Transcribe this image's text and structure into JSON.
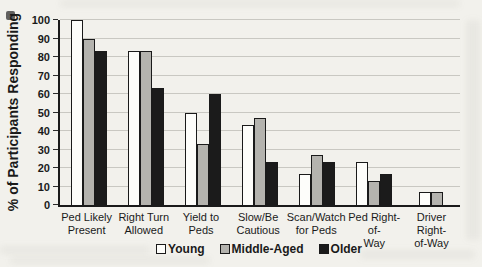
{
  "figure": {
    "background_color": "#f2f1ec",
    "axis_color": "#1a1a1a",
    "gridline_color": "#c9c8c2"
  },
  "chart_data": {
    "type": "bar",
    "title": "",
    "xlabel": "",
    "ylabel": "% of Participants Responding",
    "ylim": [
      0,
      100
    ],
    "ytick_step": 10,
    "yticks": [
      0,
      10,
      20,
      30,
      40,
      50,
      60,
      70,
      80,
      90,
      100
    ],
    "grid": "horizontal",
    "legend_position": "bottom",
    "categories": [
      "Ped Likely Present",
      "Right Turn Allowed",
      "Yield to Peds",
      "Slow/Be Cautious",
      "Scan/Watch for Peds",
      "Ped Right-of-Way",
      "Driver Right-of-Way"
    ],
    "category_label_lines": [
      [
        "Ped Likely",
        "Present"
      ],
      [
        "Right Turn",
        "Allowed"
      ],
      [
        "Yield to Peds"
      ],
      [
        "Slow/Be",
        "Cautious"
      ],
      [
        "Scan/Watch",
        "for Peds"
      ],
      [
        "Ped Right-of-",
        "Way"
      ],
      [
        "Driver Right-",
        "of-Way"
      ]
    ],
    "series": [
      {
        "name": "Young",
        "fill": "#fdfdfa",
        "border": "#1a1a1a",
        "values": [
          100,
          83,
          50,
          43,
          17,
          23,
          7
        ]
      },
      {
        "name": "Middle-Aged",
        "fill": "#b4b3ae",
        "border": "#1a1a1a",
        "values": [
          90,
          83,
          33,
          47,
          27,
          13,
          7
        ]
      },
      {
        "name": "Older",
        "fill": "#1b1b1b",
        "border": "#1a1a1a",
        "values": [
          83,
          63,
          60,
          23,
          23,
          17,
          0
        ]
      }
    ]
  }
}
